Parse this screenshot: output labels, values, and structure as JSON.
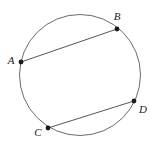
{
  "figure": {
    "kind": "geometry-diagram",
    "background_color": "#ffffff",
    "circle": {
      "name": "circle",
      "center_x": 80,
      "center_y": 75,
      "radius": 60.5,
      "stroke_color": "#6b6b6b",
      "stroke_width": 1
    },
    "points": [
      {
        "label": "A",
        "x": 21,
        "y": 62,
        "label_x": 11,
        "label_y": 61,
        "dot_radius": 2.4
      },
      {
        "label": "B",
        "x": 117,
        "y": 29,
        "label_x": 117,
        "label_y": 17,
        "dot_radius": 2.4
      },
      {
        "label": "C",
        "x": 48,
        "y": 128,
        "label_x": 38,
        "label_y": 133,
        "dot_radius": 2.4
      },
      {
        "label": "D",
        "x": 134,
        "y": 101,
        "label_x": 143,
        "label_y": 110,
        "dot_radius": 2.4
      }
    ],
    "chords": [
      {
        "name": "chord-ab",
        "from": "A",
        "to": "B",
        "x1": 21,
        "y1": 62,
        "x2": 117,
        "y2": 29,
        "stroke_color": "#555555"
      },
      {
        "name": "chord-cd",
        "from": "C",
        "to": "D",
        "x1": 48,
        "y1": 128,
        "x2": 134,
        "y2": 101,
        "stroke_color": "#555555"
      }
    ]
  }
}
